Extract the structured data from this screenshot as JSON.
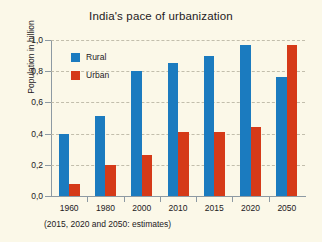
{
  "chart_data": {
    "type": "bar",
    "title": "India's pace of urbanization",
    "xlabel": "",
    "ylabel": "Population in billion",
    "footnote": "(2015, 2020 and 2050: estimates)",
    "categories": [
      "1960",
      "1980",
      "2000",
      "2010",
      "2015",
      "2020",
      "2050"
    ],
    "series": [
      {
        "name": "Rural",
        "color": "#1b7bbf",
        "values": [
          0.4,
          0.51,
          0.8,
          0.85,
          0.9,
          0.97,
          0.76
        ]
      },
      {
        "name": "Urban",
        "color": "#d53a18",
        "values": [
          0.08,
          0.2,
          0.26,
          0.41,
          0.41,
          0.44,
          0.97
        ]
      }
    ],
    "ylim": [
      0.0,
      1.0
    ],
    "ytick_labels": [
      "1,0",
      "0,8",
      "0,6",
      "0,4",
      "0,2",
      "0,0"
    ],
    "ytick_values": [
      1.0,
      0.8,
      0.6,
      0.4,
      0.2,
      0.0
    ],
    "grid": true,
    "legend_position": "upper-left-inside",
    "background_color": "#fbf8e8"
  }
}
